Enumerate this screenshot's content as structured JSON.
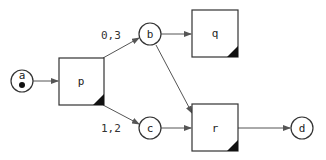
{
  "diagram": {
    "type": "petri-net",
    "places": [
      {
        "id": "a",
        "label": "a",
        "token": true
      },
      {
        "id": "b",
        "label": "b",
        "token": false
      },
      {
        "id": "c",
        "label": "c",
        "token": false
      },
      {
        "id": "d",
        "label": "d",
        "token": false
      }
    ],
    "transitions": [
      {
        "id": "p",
        "label": "p"
      },
      {
        "id": "q",
        "label": "q"
      },
      {
        "id": "r",
        "label": "r"
      }
    ],
    "arcs": [
      {
        "from": "a",
        "to": "p",
        "label": ""
      },
      {
        "from": "p",
        "to": "b",
        "label": "0,3"
      },
      {
        "from": "p",
        "to": "c",
        "label": "1,2"
      },
      {
        "from": "b",
        "to": "q",
        "label": ""
      },
      {
        "from": "b",
        "to": "r",
        "label": ""
      },
      {
        "from": "c",
        "to": "r",
        "label": ""
      },
      {
        "from": "r",
        "to": "d",
        "label": ""
      }
    ],
    "edge_labels": {
      "p_b": "0,3",
      "p_c": "1,2"
    },
    "colors": {
      "stroke": "#333333",
      "fill": "#ffffff",
      "token": "#111111"
    }
  }
}
